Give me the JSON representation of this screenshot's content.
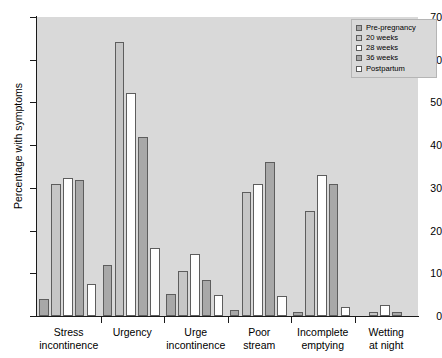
{
  "chart_data": {
    "type": "bar",
    "title": "",
    "subtitle": "",
    "xlabel": "",
    "ylabel": "Percentage with symptoms",
    "ylim": [
      0,
      70
    ],
    "yticks": [
      0,
      10,
      20,
      30,
      40,
      50,
      60,
      70
    ],
    "grid": false,
    "legend_position": "top-right",
    "categories": [
      "Stress incontinence",
      "Urgency",
      "Urge incontinence",
      "Poor stream",
      "Incomplete emptying",
      "Wetting at night"
    ],
    "category_lines": [
      [
        "Stress",
        "incontinence"
      ],
      [
        "Urgency",
        ""
      ],
      [
        "Urge",
        "incontinence"
      ],
      [
        "Poor",
        "stream"
      ],
      [
        "Incomplete",
        "emptying"
      ],
      [
        "Wetting",
        "at night"
      ]
    ],
    "series": [
      {
        "name": "Pre-pregnancy",
        "color": "#a8a8a8",
        "values": [
          4.0,
          12.0,
          5.2,
          1.5,
          1.0,
          0.0
        ]
      },
      {
        "name": "20 weeks",
        "color": "#c6c6c6",
        "values": [
          31.0,
          64.2,
          10.5,
          29.0,
          24.5,
          1.0
        ]
      },
      {
        "name": "28 weeks",
        "color": "#ffffff",
        "values": [
          32.2,
          52.3,
          14.5,
          31.0,
          33.0,
          2.5
        ]
      },
      {
        "name": "36 weeks",
        "color": "#a8a8a8",
        "values": [
          31.8,
          41.8,
          8.4,
          36.0,
          31.0,
          1.0
        ]
      },
      {
        "name": "Postpartum",
        "color": "#ffffff",
        "values": [
          7.5,
          16.0,
          5.0,
          4.8,
          2.0,
          0.0
        ]
      }
    ]
  },
  "legend": {
    "items": [
      {
        "label": "Pre-pregnancy"
      },
      {
        "label": "20 weeks"
      },
      {
        "label": "28 weeks"
      },
      {
        "label": "36 weeks"
      },
      {
        "label": "Postpartum"
      }
    ]
  },
  "colors": {
    "plot_background": "#d9d9d9",
    "axis": "#1a1a1a",
    "bar_border": "#5d5d5d",
    "dark_gray": "#a8a8a8",
    "light_gray": "#c6c6c6",
    "white": "#ffffff"
  }
}
